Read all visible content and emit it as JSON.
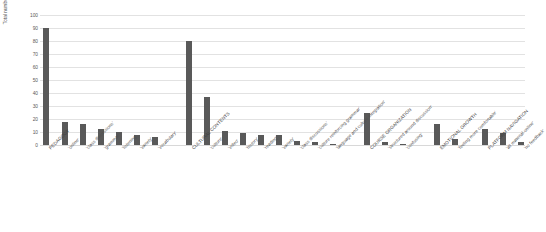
{
  "chart_data": {
    "type": "bar",
    "title": "",
    "xlabel": "",
    "ylabel": "Total number of comments",
    "ylim": [
      0,
      100
    ],
    "ytick_labels": [
      "100",
      "90",
      "80",
      "70",
      "60",
      "50",
      "40",
      "30",
      "20",
      "10",
      "0"
    ],
    "yticks": [
      100,
      90,
      80,
      70,
      60,
      50,
      40,
      30,
      20,
      10,
      0
    ],
    "grid": true,
    "legend": "none",
    "bar_color": "#595959",
    "categories": [
      "PEDAGOGY",
      "'online'",
      "'class discussions'",
      "'grammar'",
      "'listening'",
      "'variety'",
      "'vocabulary'",
      "CULTURAL CONTENTS",
      "'culture'",
      "'video'",
      "'history'",
      "'reading'",
      "'variety'",
      "'class discussions'",
      "'culture reinforcing grammar'",
      "'language and culture integration'",
      "COURSE ORGANIZATION",
      "'structured around discussion'",
      "'confusing'",
      "EMOTIONAL GROWTH",
      "'feeling more comfortable'",
      "PLATFORM NAVIGATION",
      "'all material online'",
      "'no feedback'"
    ],
    "values": [
      90,
      18,
      16,
      12,
      10,
      8,
      6,
      80,
      37,
      11,
      9,
      8,
      8,
      3,
      2,
      1,
      25,
      2,
      1,
      16,
      5,
      12,
      9,
      2
    ],
    "groups": [
      {
        "name": "PEDAGOGY",
        "members": [
          "'online'",
          "'class discussions'",
          "'grammar'",
          "'listening'",
          "'variety'",
          "'vocabulary'"
        ]
      },
      {
        "name": "CULTURAL CONTENTS",
        "members": [
          "'culture'",
          "'video'",
          "'history'",
          "'reading'",
          "'variety'",
          "'class discussions'",
          "'culture reinforcing grammar'",
          "'language and culture integration'"
        ]
      },
      {
        "name": "COURSE ORGANIZATION",
        "members": [
          "'structured around discussion'",
          "'confusing'"
        ]
      },
      {
        "name": "EMOTIONAL GROWTH",
        "members": [
          "'feeling more comfortable'"
        ]
      },
      {
        "name": "PLATFORM NAVIGATION",
        "members": [
          "'all material online'",
          "'no feedback'"
        ]
      }
    ]
  },
  "axis": {
    "y_title": "Total number of comments"
  }
}
